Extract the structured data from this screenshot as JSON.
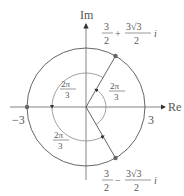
{
  "diagram": {
    "axes": {
      "real_label": "Re",
      "imag_label": "Im"
    },
    "circle_radius_label_pos": "3",
    "circle_radius_label_neg": "−3",
    "points": [
      {
        "name": "upper",
        "real_num": "3",
        "real_den": "2",
        "op": "+",
        "imag_num": "3√3",
        "imag_den": "2",
        "unit": "i"
      },
      {
        "name": "lower",
        "real_num": "3",
        "real_den": "2",
        "op": "−",
        "imag_num": "3√3",
        "imag_den": "2",
        "unit": "i"
      }
    ],
    "angles": [
      {
        "num": "2π",
        "den": "3",
        "position": "upper-left"
      },
      {
        "num": "2π",
        "den": "3",
        "position": "right-inner"
      },
      {
        "num": "2π",
        "den": "3",
        "position": "bottom"
      }
    ],
    "colors": {
      "line": "#555555",
      "point": "#666666"
    }
  }
}
